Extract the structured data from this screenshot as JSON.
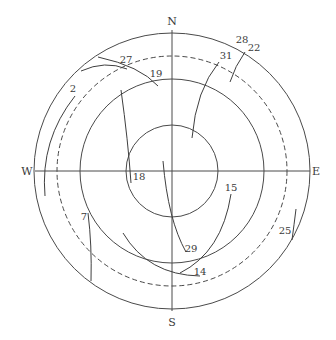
{
  "diagram": {
    "type": "polar-sky-plot",
    "compass": {
      "north": "N",
      "south": "S",
      "west": "W",
      "east": "E"
    },
    "rings": [
      {
        "name": "inner-ring",
        "style": "solid"
      },
      {
        "name": "middle-ring",
        "style": "solid"
      },
      {
        "name": "dashed-ring",
        "style": "dashed"
      },
      {
        "name": "outer-ring",
        "style": "solid"
      }
    ],
    "tracks": [
      {
        "id": "2",
        "label": "2"
      },
      {
        "id": "7",
        "label": "7"
      },
      {
        "id": "14",
        "label": "14"
      },
      {
        "id": "15",
        "label": "15"
      },
      {
        "id": "18",
        "label": "18"
      },
      {
        "id": "19",
        "label": "19"
      },
      {
        "id": "22",
        "label": "22"
      },
      {
        "id": "25",
        "label": "25"
      },
      {
        "id": "27",
        "label": "27"
      },
      {
        "id": "28",
        "label": "28"
      },
      {
        "id": "29",
        "label": "29"
      },
      {
        "id": "31",
        "label": "31"
      }
    ],
    "colors": {
      "line": "#4a4a4a",
      "background": "#ffffff"
    }
  }
}
